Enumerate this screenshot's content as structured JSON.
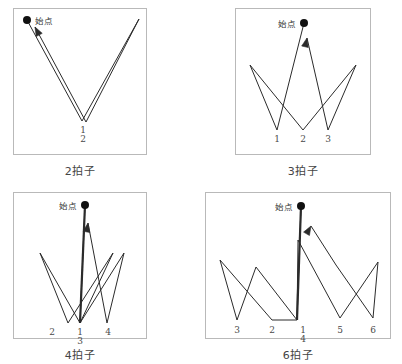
{
  "figure": {
    "title_visible": false,
    "colors": {
      "stroke": "#2b2b2b",
      "frame": "#b9b9b9",
      "background": "#ffffff",
      "label": "#4a4a4a"
    }
  },
  "panels": [
    {
      "id": "panel-2beat",
      "caption": "2拍子",
      "start_label": "始点",
      "start_label_side": "right",
      "beat_labels": [
        "1",
        "2"
      ],
      "beat_count": 2,
      "frame": {
        "x": 13,
        "y": 8,
        "w": 134,
        "h": 147
      },
      "start_point": {
        "x": 27,
        "y": 20
      },
      "path": [
        {
          "x": 27,
          "y": 20
        },
        {
          "x": 82,
          "y": 121
        },
        {
          "x": 139,
          "y": 19
        },
        {
          "x": 86,
          "y": 122
        },
        {
          "x": 35,
          "y": 27
        }
      ],
      "arrow_at": {
        "x": 35,
        "y": 27,
        "angle_deg": 242
      },
      "beat_marks": [
        {
          "label": "1",
          "x": 83,
          "y": 133
        },
        {
          "label": "2",
          "x": 83,
          "y": 142
        }
      ]
    },
    {
      "id": "panel-3beat",
      "caption": "3拍子",
      "start_label": "始点",
      "start_label_side": "left",
      "beat_labels": [
        "1",
        "2",
        "3"
      ],
      "beat_count": 3,
      "frame": {
        "x": 235,
        "y": 8,
        "w": 136,
        "h": 147
      },
      "start_point": {
        "x": 304,
        "y": 23
      },
      "path": [
        {
          "x": 304,
          "y": 23
        },
        {
          "x": 277,
          "y": 130
        },
        {
          "x": 250,
          "y": 65
        },
        {
          "x": 303,
          "y": 130
        },
        {
          "x": 356,
          "y": 65
        },
        {
          "x": 328,
          "y": 130
        },
        {
          "x": 307,
          "y": 38
        }
      ],
      "arrow_at": {
        "x": 307,
        "y": 38,
        "angle_deg": 283
      },
      "beat_marks": [
        {
          "label": "1",
          "x": 277,
          "y": 142
        },
        {
          "label": "2",
          "x": 303,
          "y": 142
        },
        {
          "label": "3",
          "x": 328,
          "y": 142
        }
      ]
    },
    {
      "id": "panel-4beat",
      "caption": "4拍子",
      "start_label": "始点",
      "start_label_side": "left",
      "beat_labels": [
        "1",
        "2",
        "3",
        "4"
      ],
      "beat_count": 4,
      "frame": {
        "x": 13,
        "y": 192,
        "w": 134,
        "h": 147
      },
      "start_point": {
        "x": 85,
        "y": 205
      },
      "path": [
        {
          "x": 85,
          "y": 205
        },
        {
          "x": 80,
          "y": 323
        },
        {
          "x": 40,
          "y": 253
        },
        {
          "x": 68,
          "y": 323
        },
        {
          "x": 113,
          "y": 253
        },
        {
          "x": 80,
          "y": 323
        },
        {
          "x": 124,
          "y": 253
        },
        {
          "x": 107,
          "y": 323
        },
        {
          "x": 88,
          "y": 223
        }
      ],
      "arrow_at": {
        "x": 88,
        "y": 223,
        "angle_deg": 280
      },
      "beat_marks": [
        {
          "label": "2",
          "x": 52,
          "y": 335
        },
        {
          "label": "1",
          "x": 80,
          "y": 335
        },
        {
          "label": "3",
          "x": 80,
          "y": 344
        },
        {
          "label": "4",
          "x": 108,
          "y": 335
        }
      ]
    },
    {
      "id": "panel-6beat",
      "caption": "6拍子",
      "start_label": "始点",
      "start_label_side": "left",
      "beat_labels": [
        "1",
        "2",
        "3",
        "4",
        "5",
        "6"
      ],
      "beat_count": 6,
      "frame": {
        "x": 205,
        "y": 192,
        "w": 186,
        "h": 147
      },
      "start_point": {
        "x": 301,
        "y": 206
      },
      "path": [
        {
          "x": 301,
          "y": 206
        },
        {
          "x": 297,
          "y": 320
        },
        {
          "x": 256,
          "y": 267
        },
        {
          "x": 237,
          "y": 320
        },
        {
          "x": 220,
          "y": 260
        },
        {
          "x": 272,
          "y": 320
        },
        {
          "x": 297,
          "y": 320
        },
        {
          "x": 298,
          "y": 240
        },
        {
          "x": 340,
          "y": 318
        },
        {
          "x": 378,
          "y": 262
        },
        {
          "x": 373,
          "y": 318
        },
        {
          "x": 336,
          "y": 265
        },
        {
          "x": 311,
          "y": 226
        }
      ],
      "arrow_at": {
        "x": 311,
        "y": 226,
        "angle_deg": 300
      },
      "beat_marks": [
        {
          "label": "3",
          "x": 237,
          "y": 333
        },
        {
          "label": "2",
          "x": 272,
          "y": 333
        },
        {
          "label": "1",
          "x": 303,
          "y": 333
        },
        {
          "label": "4",
          "x": 303,
          "y": 342
        },
        {
          "label": "5",
          "x": 340,
          "y": 333
        },
        {
          "label": "6",
          "x": 373,
          "y": 333
        }
      ]
    }
  ]
}
